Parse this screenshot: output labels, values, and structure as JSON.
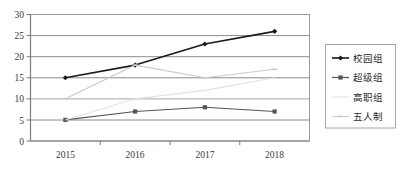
{
  "chart_data": {
    "type": "line",
    "title": "",
    "subtitle": "",
    "xlabel": "",
    "ylabel": "",
    "categories": [
      "2015",
      "2016",
      "2017",
      "2018"
    ],
    "ylim": [
      0,
      30
    ],
    "yticks": [
      0,
      5,
      10,
      15,
      20,
      25,
      30
    ],
    "ytick_labels": [
      "0",
      "5",
      "10",
      "15",
      "20",
      "25",
      "30"
    ],
    "grid": "horizontal",
    "legend_position": "right",
    "series": [
      {
        "name": "校园组",
        "values": [
          15,
          18,
          23,
          26
        ],
        "color": "#1a1a1a",
        "marker": "diamond",
        "width": 1.6
      },
      {
        "name": "超级组",
        "values": [
          5,
          7,
          8,
          7
        ],
        "color": "#555555",
        "marker": "square",
        "width": 1.2
      },
      {
        "name": "高职组",
        "values": [
          5,
          10,
          12,
          15
        ],
        "color": "#e2e2e2",
        "marker": "none",
        "width": 1.1
      },
      {
        "name": "五人制",
        "values": [
          10,
          18,
          15,
          17
        ],
        "color": "#c9c9c9",
        "marker": "dash",
        "width": 1.1
      }
    ]
  },
  "axis": {
    "y_labels": [
      "30",
      "25",
      "20",
      "15",
      "10",
      "5",
      "0"
    ],
    "x_labels": [
      "2015",
      "2016",
      "2017",
      "2018"
    ]
  },
  "legend": {
    "entries": [
      {
        "label": "校园组"
      },
      {
        "label": "超级组"
      },
      {
        "label": "高职组"
      },
      {
        "label": "五人制"
      }
    ]
  },
  "colors": {
    "plot_border": "#9a9a9a",
    "gridline": "#8c8c8c",
    "legend_border": "#a8a8a8",
    "background": "#ffffff"
  }
}
